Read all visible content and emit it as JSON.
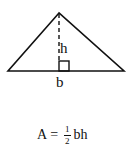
{
  "diagram": {
    "type": "triangle-area",
    "shape": {
      "apex": [
        59,
        13
      ],
      "base_left": [
        8,
        71
      ],
      "base_right": [
        124,
        71
      ],
      "altitude_style": "dashed",
      "right_angle_marker": true
    },
    "labels": {
      "height": "h",
      "base": "b"
    },
    "formula": {
      "lhs": "A",
      "equals": "=",
      "fraction_numerator": "1",
      "fraction_denominator": "2",
      "rhs_variables": "bh"
    },
    "colors": {
      "stroke": "#111111",
      "background": "#ffffff"
    }
  }
}
